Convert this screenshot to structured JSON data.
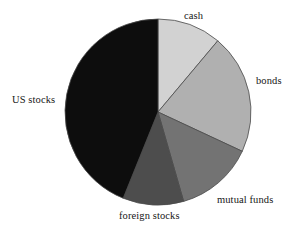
{
  "chart_data": {
    "type": "pie",
    "title": "",
    "subtitle": "",
    "xlabel": "",
    "ylabel": "",
    "grid": false,
    "legend_position": "none",
    "label_placement": "outside-adjacent-to-slice",
    "start_angle_deg": 0,
    "direction": "clockwise",
    "center_px": [
      158,
      112
    ],
    "radius_px": 93,
    "categories": [
      "cash",
      "bonds",
      "mutual funds",
      "foreign stocks",
      "US stocks"
    ],
    "values": [
      11,
      21,
      13.5,
      10.5,
      44
    ],
    "value_unit": "percent",
    "slices": [
      {
        "label": "cash",
        "value": 11,
        "start_angle_deg": 0,
        "end_angle_deg": 40,
        "color": "#d2d2d2",
        "label_pos_px": [
          184,
          11
        ]
      },
      {
        "label": "bonds",
        "value": 21,
        "start_angle_deg": 40,
        "end_angle_deg": 115,
        "color": "#b0b0b0",
        "label_pos_px": [
          256,
          76
        ]
      },
      {
        "label": "mutual funds",
        "value": 13.5,
        "start_angle_deg": 115,
        "end_angle_deg": 164,
        "color": "#737373",
        "label_pos_px": [
          217,
          195
        ]
      },
      {
        "label": "foreign stocks",
        "value": 10.5,
        "start_angle_deg": 164,
        "end_angle_deg": 202,
        "color": "#4d4d4d",
        "label_pos_px": [
          119,
          211
        ]
      },
      {
        "label": "US stocks",
        "value": 44,
        "start_angle_deg": 202,
        "end_angle_deg": 360,
        "color": "#0d0d0d",
        "label_pos_px": [
          12,
          95
        ]
      }
    ],
    "colors": [
      "#d2d2d2",
      "#b0b0b0",
      "#737373",
      "#4d4d4d",
      "#0d0d0d"
    ],
    "stroke_color": "#4a4a4a",
    "background_color": "#ffffff"
  },
  "labels": {
    "cash": "cash",
    "bonds": "bonds",
    "mutual_funds": "mutual funds",
    "foreign_stocks": "foreign stocks",
    "us_stocks": "US stocks"
  }
}
